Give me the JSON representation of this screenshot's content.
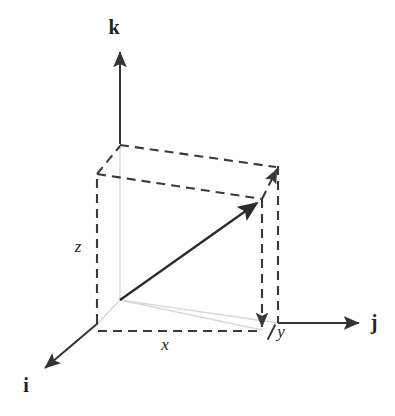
{
  "figure": {
    "background_color": "#ffffff",
    "width": 395,
    "height": 416
  },
  "colors": {
    "line_dark": "#333333",
    "line_dashed": "#3a3a3a",
    "line_faint": "#d8d8d8",
    "text": "#222222"
  },
  "axes": [
    {
      "id": "i",
      "label": "i",
      "description": "x-axis unit vector pointing down-left toward viewer",
      "label_x": 26,
      "label_y": 392,
      "arrow_from": {
        "x": 98,
        "y": 323
      },
      "arrow_to": {
        "x": 40,
        "y": 372
      }
    },
    {
      "id": "j",
      "label": "j",
      "description": "y-axis unit vector pointing right",
      "label_x": 374,
      "label_y": 329,
      "arrow_from": {
        "x": 278,
        "y": 323
      },
      "arrow_to": {
        "x": 366,
        "y": 323
      }
    },
    {
      "id": "k",
      "label": "k",
      "description": "z-axis unit vector pointing up",
      "label_x": 114,
      "label_y": 34,
      "arrow_from": {
        "x": 120,
        "y": 144
      },
      "arrow_to": {
        "x": 120,
        "y": 45
      }
    }
  ],
  "components": [
    {
      "id": "x",
      "label": "x",
      "description": "x component measured along bottom front dashed edge",
      "label_x": 165,
      "label_y": 350
    },
    {
      "id": "y",
      "label": "y",
      "description": "y component measured at right bottom corner",
      "label_x": 281,
      "label_y": 337
    },
    {
      "id": "z",
      "label": "z",
      "description": "z component measured along left vertical dashed edge",
      "label_x": 78,
      "label_y": 252
    }
  ],
  "vector": {
    "description": "position vector from origin to opposite corner of box",
    "tail": {
      "x": 120,
      "y": 300
    },
    "head": {
      "x": 263,
      "y": 199
    }
  },
  "box": {
    "description": "dashed rectangular box showing vector components",
    "corners": {
      "origin_front_bottom_left": {
        "x": 98,
        "y": 323
      },
      "inner_bottom_left": {
        "x": 120,
        "y": 300
      },
      "front_top_left": {
        "x": 97,
        "y": 174
      },
      "back_top_left": {
        "x": 120,
        "y": 144
      },
      "back_top_right": {
        "x": 278,
        "y": 166
      },
      "front_top_right": {
        "x": 262,
        "y": 199
      },
      "front_bottom_right": {
        "x": 262,
        "y": 330
      },
      "back_bottom_right": {
        "x": 278,
        "y": 323
      }
    }
  }
}
